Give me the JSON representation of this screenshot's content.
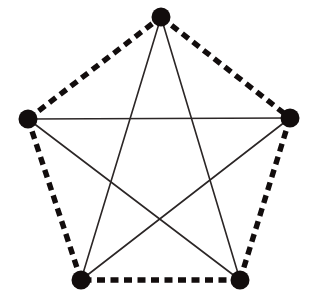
{
  "figure": {
    "type": "graph-diagram",
    "canvas": {
      "width": 313,
      "height": 303,
      "background": "#ffffff"
    },
    "style": {
      "ink_color": "#120d0d",
      "dashed_edge_color": "#120d0d",
      "solid_edge_color": "#2b2626",
      "dashed_edge_width": 5.4,
      "solid_edge_width": 1.6,
      "dash_pattern": "8 5.5",
      "vertex_radius": 9.5,
      "vertex_color": "#120d0d"
    },
    "vertices": [
      {
        "id": "v1",
        "label": "top",
        "x": 161,
        "y": 17
      },
      {
        "id": "v2",
        "label": "right",
        "x": 290,
        "y": 118
      },
      {
        "id": "v3",
        "label": "bottom-right",
        "x": 240,
        "y": 280
      },
      {
        "id": "v4",
        "label": "bottom-left",
        "x": 81,
        "y": 280
      },
      {
        "id": "v5",
        "label": "left",
        "x": 28,
        "y": 119
      }
    ],
    "edges": [
      {
        "id": "e1",
        "from": "v1",
        "to": "v2",
        "style": "dashed",
        "name": "edge-top-right"
      },
      {
        "id": "e2",
        "from": "v2",
        "to": "v3",
        "style": "dashed",
        "name": "edge-right-bottomright"
      },
      {
        "id": "e3",
        "from": "v3",
        "to": "v4",
        "style": "dashed",
        "name": "edge-bottomright-bottomleft"
      },
      {
        "id": "e4",
        "from": "v4",
        "to": "v5",
        "style": "dashed",
        "name": "edge-bottomleft-left"
      },
      {
        "id": "e5",
        "from": "v5",
        "to": "v1",
        "style": "dashed",
        "name": "edge-left-top"
      },
      {
        "id": "d1",
        "from": "v1",
        "to": "v3",
        "style": "solid",
        "name": "diagonal-top-bottomright"
      },
      {
        "id": "d2",
        "from": "v1",
        "to": "v4",
        "style": "solid",
        "name": "diagonal-top-bottomleft"
      },
      {
        "id": "d3",
        "from": "v2",
        "to": "v4",
        "style": "solid",
        "name": "diagonal-right-bottomleft"
      },
      {
        "id": "d4",
        "from": "v2",
        "to": "v5",
        "style": "solid",
        "name": "diagonal-right-left"
      },
      {
        "id": "d5",
        "from": "v3",
        "to": "v5",
        "style": "solid",
        "name": "diagonal-bottomright-left"
      }
    ]
  }
}
